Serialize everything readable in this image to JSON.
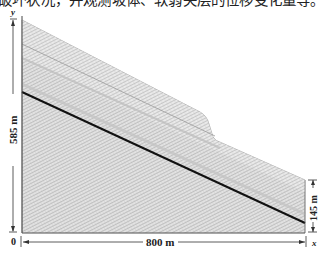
{
  "caption": {
    "text": "破坏状况，并观测坡体、软弱夹层的位移变化量等。"
  },
  "figure": {
    "axes": {
      "y_label": "y",
      "x_label": "x",
      "origin_label": "0"
    },
    "dimensions": {
      "left_height": "585 m",
      "right_height": "145 m",
      "width": "800 m"
    },
    "colors": {
      "fill": "#e6e6e6",
      "hatch": "#b5b5b5",
      "band": "#cfcfcf",
      "weak_layer": "#111111",
      "outline": "#555555"
    }
  }
}
